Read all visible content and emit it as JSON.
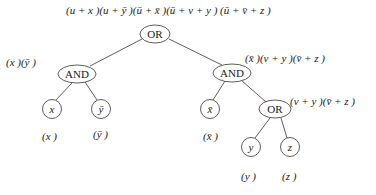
{
  "diagram": {
    "root_expression": "(u + x)(u + ȳ)(ū + x̄)(ū + v + y) (ū + v̄ + z)",
    "nodes": [
      {
        "id": "or_root",
        "label": "OR",
        "shape": "ellipse",
        "cx": 155,
        "cy": 34
      },
      {
        "id": "and_left",
        "label": "AND",
        "shape": "ellipse",
        "cx": 77,
        "cy": 74,
        "annotation": "(x)(ȳ)"
      },
      {
        "id": "and_right",
        "label": "AND",
        "shape": "ellipse",
        "cx": 232,
        "cy": 73,
        "annotation": "(x̄)(v + y)(v̄ + z)"
      },
      {
        "id": "leaf_x",
        "label": "x",
        "shape": "circle",
        "cx": 52,
        "cy": 109,
        "annotation": "(x)"
      },
      {
        "id": "leaf_ybar",
        "label": "ȳ",
        "shape": "circle",
        "cx": 101,
        "cy": 109,
        "annotation": "(ȳ)"
      },
      {
        "id": "leaf_xbar",
        "label": "x̄",
        "shape": "circle",
        "cx": 210,
        "cy": 109,
        "annotation": "(x̄)"
      },
      {
        "id": "or_inner",
        "label": "OR",
        "shape": "ellipse",
        "cx": 275,
        "cy": 109,
        "annotation": "(v + y)(v̄ + z)"
      },
      {
        "id": "leaf_y",
        "label": "y",
        "shape": "circle",
        "cx": 251,
        "cy": 147,
        "annotation": "(y)"
      },
      {
        "id": "leaf_z",
        "label": "z",
        "shape": "circle",
        "cx": 290,
        "cy": 147,
        "annotation": "(z)"
      }
    ],
    "edges": [
      [
        "or_root",
        "and_left"
      ],
      [
        "or_root",
        "and_right"
      ],
      [
        "and_left",
        "leaf_x"
      ],
      [
        "and_left",
        "leaf_ybar"
      ],
      [
        "and_right",
        "leaf_xbar"
      ],
      [
        "and_right",
        "or_inner"
      ],
      [
        "or_inner",
        "leaf_y"
      ],
      [
        "or_inner",
        "leaf_z"
      ]
    ],
    "labels": {
      "root": "(u + x )(u + ȳ )(ū + x̄ )(ū + v + y ) (ū + v̄ + z )",
      "and_left": "(x )(ȳ )",
      "and_right": "(x̄ )(v + y )(v̄ + z )",
      "or_inner": "(v + y )(v̄ + z )",
      "leaf_x": "(x )",
      "leaf_ybar": "(ȳ )",
      "leaf_xbar": "(x̄ )",
      "leaf_y": "(y )",
      "leaf_z": "(z )"
    },
    "node_text": {
      "or_root": "OR",
      "and_left": "AND",
      "and_right": "AND",
      "or_inner": "OR",
      "x": "x",
      "ybar": "ȳ",
      "xbar": "x̄",
      "y": "y",
      "z": "z"
    }
  }
}
